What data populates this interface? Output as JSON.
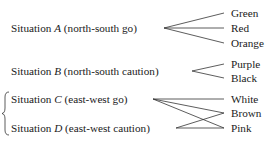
{
  "situations": [
    {
      "prefix": "Situation ",
      "letter": "A",
      "desc": " (north-south go)"
    },
    {
      "prefix": "Situation ",
      "letter": "B",
      "desc": " (north-south caution)"
    },
    {
      "prefix": "Situation ",
      "letter": "C",
      "desc": " (east-west go)"
    },
    {
      "prefix": "Situation ",
      "letter": "D",
      "desc": " (east-west caution)"
    }
  ],
  "colors": [
    "Green",
    "Red",
    "Orange",
    "Purple",
    "Black",
    "White",
    "Brown",
    "Pink"
  ],
  "mappings": {
    "A": [
      "Green",
      "Red",
      "Orange"
    ],
    "B": [
      "Purple",
      "Black"
    ],
    "C": [
      "White",
      "Brown",
      "Pink"
    ],
    "D": [
      "Brown",
      "Pink"
    ]
  },
  "bracket": "{"
}
